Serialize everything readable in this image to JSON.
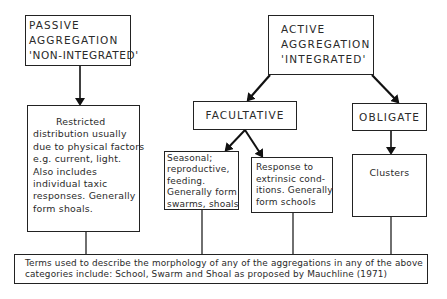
{
  "diagram": {
    "passive": {
      "lines": [
        "PASSIVE",
        "AGGREGATION",
        "'NON-INTEGRATED'"
      ]
    },
    "active": {
      "lines": [
        "ACTIVE",
        "AGGREGATION",
        "'INTEGRATED'"
      ]
    },
    "restricted": {
      "lines": [
        "Restricted",
        "distribution usually",
        "due to physical factors",
        "e.g. current, light.",
        "Also includes",
        "individual taxic",
        "responses. Generally",
        "form shoals."
      ]
    },
    "facultative": {
      "label": "FACULTATIVE"
    },
    "obligate": {
      "label": "OBLIGATE"
    },
    "seasonal": {
      "lines": [
        "Seasonal;",
        "reproductive,",
        "feeding.",
        "Generally form",
        "swarms, shoals"
      ]
    },
    "response": {
      "lines": [
        "Response to",
        "extrinsic cond-",
        "itions. Generally",
        "form schools"
      ]
    },
    "clusters": {
      "label": "Clusters"
    },
    "terms": {
      "lines": [
        "Terms used to describe the morphology of any of the aggregations in any of the above",
        "categories include: School, Swarm and Shoal as proposed by Mauchline (1971)"
      ]
    }
  }
}
